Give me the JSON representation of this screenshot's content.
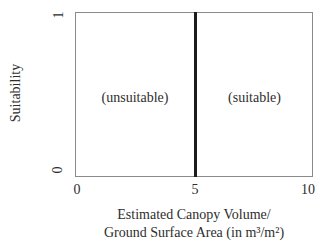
{
  "figure": {
    "background": "#ffffff",
    "colors": {
      "box_border": "#8a8a8a",
      "threshold_line": "#1c1c1c",
      "text": "#2e2e2e"
    }
  },
  "chart_data": {
    "type": "line",
    "title": "",
    "xlabel_line1": "Estimated Canopy Volume/",
    "xlabel_line2": "Ground Surface Area (in m³/m²)",
    "ylabel": "Suitability",
    "xlim": [
      0,
      10
    ],
    "ylim": [
      0,
      1
    ],
    "xticks": [
      "0",
      "5",
      "10"
    ],
    "yticks": [
      "0",
      "1"
    ],
    "grid": false,
    "legend": false,
    "series": [
      {
        "name": "suitability-step-threshold",
        "style": "thick-vertical-line",
        "x": [
          5,
          5
        ],
        "y": [
          0,
          1
        ]
      }
    ],
    "annotations": [
      {
        "text": "(unsuitable)",
        "x": 2.5,
        "y": 0.5
      },
      {
        "text": "(suitable)",
        "x": 7.5,
        "y": 0.5
      }
    ]
  }
}
